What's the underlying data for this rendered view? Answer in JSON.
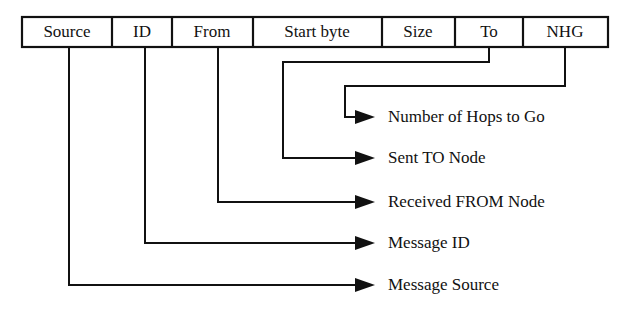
{
  "diagram": {
    "colors": {
      "ink": "#111111",
      "background": "#ffffff"
    },
    "header_table": {
      "name": "message-header-fields",
      "fields": [
        {
          "label": "Source",
          "x": 22,
          "width": 90
        },
        {
          "label": "ID",
          "x": 112,
          "width": 60
        },
        {
          "label": "From",
          "x": 172,
          "width": 81
        },
        {
          "label": "Start byte",
          "x": 253,
          "width": 129
        },
        {
          "label": "Size",
          "x": 382,
          "width": 73
        },
        {
          "label": "To",
          "x": 455,
          "width": 68
        },
        {
          "label": "NHG",
          "x": 523,
          "width": 85
        }
      ]
    },
    "callouts": [
      {
        "name": "callout-nhg",
        "source_field": "NHG",
        "label": "Number of Hops to Go",
        "drop_x": 565,
        "elbow_y": 86,
        "turn_x": 345,
        "arrow_y": 117
      },
      {
        "name": "callout-to",
        "source_field": "To",
        "label": "Sent TO Node",
        "drop_x": 489,
        "elbow_y": 62,
        "turn_x": 283,
        "arrow_y": 158
      },
      {
        "name": "callout-from",
        "source_field": "From",
        "label": "Received FROM Node",
        "drop_x": 218,
        "elbow_y": 202,
        "turn_x": 218,
        "arrow_y": 202
      },
      {
        "name": "callout-id",
        "source_field": "ID",
        "label": "Message ID",
        "drop_x": 145,
        "elbow_y": 243,
        "turn_x": 145,
        "arrow_y": 243
      },
      {
        "name": "callout-source",
        "source_field": "Source",
        "label": "Message Source",
        "drop_x": 69,
        "elbow_y": 285,
        "turn_x": 69,
        "arrow_y": 285
      }
    ]
  }
}
